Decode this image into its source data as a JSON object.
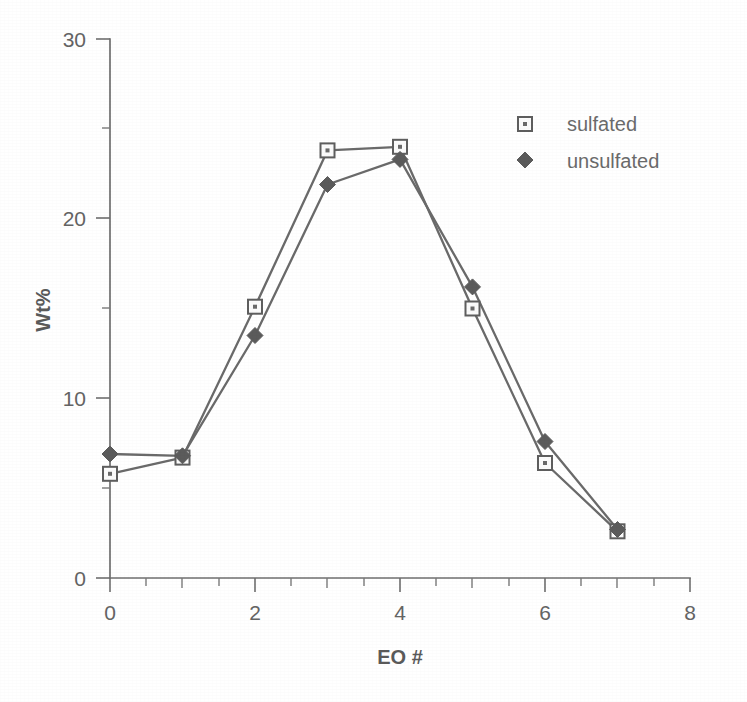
{
  "chart_data": {
    "type": "line",
    "title": "",
    "xlabel": "EO #",
    "ylabel": "Wt%",
    "x": [
      0,
      1,
      2,
      3,
      4,
      5,
      6,
      7
    ],
    "series": [
      {
        "name": "sulfated",
        "marker": "open-square",
        "color": "#6a6a6a",
        "values": [
          5.8,
          6.7,
          15.1,
          23.8,
          24.0,
          15.0,
          6.4,
          2.6
        ]
      },
      {
        "name": "unsulfated",
        "marker": "filled-diamond",
        "color": "#5b5b5b",
        "values": [
          6.9,
          6.8,
          13.5,
          21.9,
          23.3,
          16.2,
          7.6,
          2.7
        ]
      }
    ],
    "xlim": [
      0,
      8
    ],
    "ylim": [
      0,
      30
    ],
    "x_major_ticks": [
      0,
      2,
      4,
      6,
      8
    ],
    "x_minor_ticks": [
      1,
      3,
      5,
      7
    ],
    "x_tick_labels": [
      "0",
      "2",
      "4",
      "6",
      "8"
    ],
    "y_major_ticks": [
      0,
      10,
      20,
      30
    ],
    "y_minor_ticks": [
      5,
      15,
      25
    ],
    "y_tick_labels": [
      "0",
      "10",
      "20",
      "30"
    ],
    "grid": false,
    "legend_position": "top-right",
    "legend": [
      {
        "label": "sulfated",
        "marker": "open-square"
      },
      {
        "label": "unsulfated",
        "marker": "filled-diamond"
      }
    ]
  }
}
